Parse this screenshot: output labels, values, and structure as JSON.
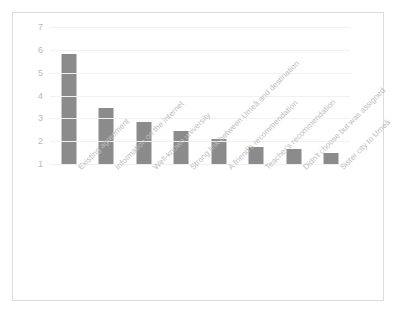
{
  "chart_data": {
    "type": "bar",
    "title": "",
    "subtitle": "",
    "xlabel": "",
    "ylabel": "",
    "ylim": [
      1,
      7
    ],
    "yticks": [
      7,
      6,
      5,
      4,
      3,
      2,
      1
    ],
    "grid": true,
    "legend": false,
    "legend_position": "none",
    "bar_color": "#8b8b8b",
    "axis_text_color": "#bdbdbd",
    "frame_color": "#dcdcdc",
    "categories": [
      "Existing agreement",
      "Information on the internet",
      "Well-known university",
      "Strong link between Umeå and destination",
      "A friend's recommendation",
      "Teacher's recommendation",
      "Didn't choose but was assigned",
      "Sister city to Umeå"
    ],
    "values": [
      5.8,
      3.45,
      2.85,
      2.45,
      2.1,
      1.75,
      1.65,
      1.5
    ]
  }
}
